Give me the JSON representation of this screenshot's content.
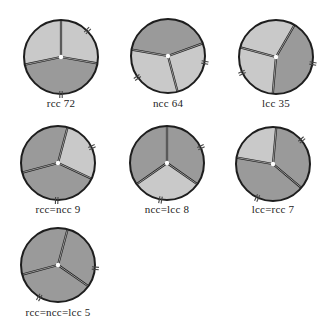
{
  "colors": {
    "light_cusp": "#c9c9c9",
    "dark_cusp": "#9a9a9a",
    "outline": "#1e1e1e",
    "background": "#ffffff"
  },
  "valves": [
    {
      "label": "rcc 72",
      "cx": 61,
      "cy": 57,
      "r": 37,
      "commissures": [
        -90,
        10,
        168
      ],
      "dark_cusps": [
        1
      ],
      "notches": [
        -45,
        90
      ],
      "label_x": 6,
      "label_y": 97
    },
    {
      "label": "ncc 64",
      "cx": 168,
      "cy": 56,
      "r": 37,
      "commissures": [
        -20,
        75,
        190
      ],
      "dark_cusps": [
        2
      ],
      "notches": [
        10,
        145
      ],
      "label_x": 113,
      "label_y": 97
    },
    {
      "label": "lcc 35",
      "cx": 276,
      "cy": 57,
      "r": 37,
      "commissures": [
        -60,
        95,
        195
      ],
      "dark_cusps": [
        0
      ],
      "notches": [
        10,
        155
      ],
      "label_x": 221,
      "label_y": 97
    },
    {
      "label": "rcc=ncc 9",
      "cx": 58,
      "cy": 163,
      "r": 37,
      "commissures": [
        -75,
        25,
        165
      ],
      "dark_cusps": [
        1,
        2
      ],
      "notches": [
        -25,
        92
      ],
      "label_x": 3,
      "label_y": 203
    },
    {
      "label": "ncc=lcc 8",
      "cx": 167,
      "cy": 163,
      "r": 37,
      "commissures": [
        -90,
        35,
        145
      ],
      "dark_cusps": [
        0,
        2
      ],
      "notches": [
        -25,
        100
      ],
      "label_x": 112,
      "label_y": 203
    },
    {
      "label": "lcc=rcc 7",
      "cx": 273,
      "cy": 164,
      "r": 37,
      "commissures": [
        -85,
        40,
        190
      ],
      "dark_cusps": [
        0,
        1
      ],
      "notches": [
        -40,
        115
      ],
      "label_x": 218,
      "label_y": 203
    },
    {
      "label": "rcc=ncc=lcc 5",
      "cx": 58,
      "cy": 265,
      "r": 37,
      "commissures": [
        -75,
        35,
        165
      ],
      "dark_cusps": [
        0,
        1,
        2
      ],
      "notches": [
        5,
        120
      ],
      "label_x": 3,
      "label_y": 306
    }
  ]
}
